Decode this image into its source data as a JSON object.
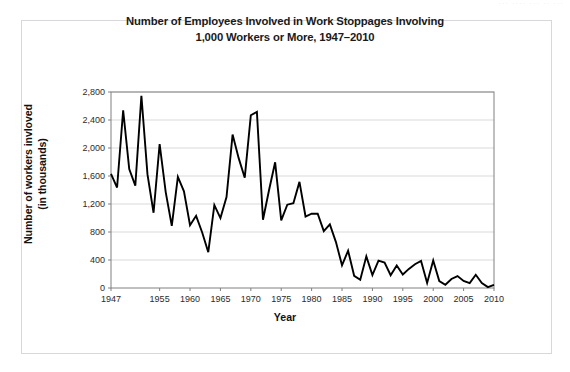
{
  "figure": {
    "title_line1": "Number of Employees Involved in Work Stoppages Involving",
    "title_line2": "1,000 Workers or More, 1947–2010",
    "ylabel_line1": "Number of workers invloved",
    "ylabel_line2": "(in thousands)",
    "xlabel": "Year",
    "scan_artifact_text": "···   ····      ···   ··  ···",
    "line_color": "#000000",
    "gridline_color": "#d9d9d9",
    "axis_color": "#808080",
    "frame_color": "#d8d8dc",
    "background_color": "#ffffff"
  },
  "chart_data": {
    "type": "line",
    "title": "Number of Employees Involved in Work Stoppages Involving 1,000 Workers or More, 1947–2010",
    "xlabel": "Year",
    "ylabel": "Number of workers invloved (in thousands)",
    "grid": true,
    "legend": "none",
    "xlim": [
      1947,
      2010
    ],
    "ylim": [
      0,
      2800
    ],
    "ytick_labels": [
      "0",
      "400",
      "800",
      "1,200",
      "1,600",
      "2,000",
      "2,400",
      "2,800"
    ],
    "ytick_values": [
      0,
      400,
      800,
      1200,
      1600,
      2000,
      2400,
      2800
    ],
    "xtick_labels": [
      "1947",
      "1955",
      "1960",
      "1965",
      "1970",
      "1975",
      "1980",
      "1985",
      "1990",
      "1995",
      "2000",
      "2005",
      "2010"
    ],
    "xtick_values": [
      1947,
      1955,
      1960,
      1965,
      1970,
      1975,
      1980,
      1985,
      1990,
      1995,
      2000,
      2005,
      2010
    ],
    "x": [
      1947,
      1948,
      1949,
      1950,
      1951,
      1952,
      1953,
      1954,
      1955,
      1956,
      1957,
      1958,
      1959,
      1960,
      1961,
      1962,
      1963,
      1964,
      1965,
      1966,
      1967,
      1968,
      1969,
      1970,
      1971,
      1972,
      1973,
      1974,
      1975,
      1976,
      1977,
      1978,
      1979,
      1980,
      1981,
      1982,
      1983,
      1984,
      1985,
      1986,
      1987,
      1988,
      1989,
      1990,
      1991,
      1992,
      1993,
      1994,
      1995,
      1996,
      1997,
      1998,
      1999,
      2000,
      2001,
      2002,
      2003,
      2004,
      2005,
      2006,
      2007,
      2008,
      2009,
      2010
    ],
    "values": [
      1629,
      1435,
      2537,
      1698,
      1462,
      2746,
      1623,
      1075,
      2055,
      1370,
      887,
      1587,
      1381,
      896,
      1031,
      793,
      512,
      1183,
      999,
      1300,
      2192,
      1855,
      1576,
      2468,
      2516,
      975,
      1400,
      1796,
      965,
      1190,
      1212,
      1516,
      1021,
      1062,
      1060,
      812,
      909,
      656,
      324,
      533,
      174,
      118,
      452,
      185,
      392,
      364,
      182,
      322,
      192,
      273,
      339,
      387,
      73,
      394,
      99,
      46,
      129,
      171,
      100,
      70,
      189,
      72,
      13,
      45
    ]
  }
}
